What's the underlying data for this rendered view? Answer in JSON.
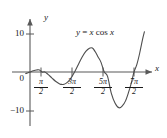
{
  "chart_data": {
    "type": "line",
    "title": "",
    "annotation": "y = x cos x",
    "function": "y = x cos x",
    "xlabel": "x",
    "ylabel": "y",
    "xlim": [
      -0.6,
      12.2
    ],
    "ylim": [
      -13.5,
      12.5
    ],
    "grid": false,
    "legend": false,
    "x_tick_labels": [
      "π/2",
      "3π/2",
      "5π/2",
      "7π/2"
    ],
    "x_tick_values": [
      1.5708,
      4.7124,
      7.854,
      10.9956
    ],
    "y_tick_labels": [
      "10",
      "0",
      "-10"
    ],
    "y_tick_values": [
      10,
      0,
      -10
    ],
    "series": [
      {
        "name": "y = x cos x",
        "x": [
          -0.45,
          -0.2,
          0,
          0.35,
          0.7,
          1.0,
          1.2708,
          1.5708,
          1.9,
          2.3,
          2.7,
          3.1416,
          3.4,
          3.6,
          3.8,
          4.0,
          4.3,
          4.7124,
          5.1,
          5.5,
          5.9,
          6.2832,
          6.6,
          6.9,
          7.2,
          7.5,
          7.854,
          8.2,
          8.6,
          9.0,
          9.42,
          9.8,
          10.1,
          10.4,
          10.7,
          10.9956,
          11.3,
          11.6,
          11.9,
          12.1
        ],
        "y": [
          -0.41,
          -0.196,
          0,
          0.329,
          0.535,
          0.54,
          0.0,
          -0.0,
          -0.614,
          -1.53,
          -2.44,
          -3.14,
          -3.27,
          -3.2,
          -3.0,
          -2.61,
          -1.73,
          0.0,
          1.93,
          3.9,
          5.43,
          6.28,
          6.3,
          5.31,
          3.94,
          2.6,
          0.0,
          -1.14,
          -5.62,
          -8.2,
          -9.42,
          -8.8,
          -7.6,
          -5.5,
          -3.0,
          0.0,
          2.0,
          5.0,
          8.6,
          10.6
        ]
      }
    ]
  },
  "labels": {
    "y_axis_name": "y",
    "x_axis_name": "x",
    "y_top": "10",
    "y_zero": "0",
    "y_bottom": "−10",
    "tick1_num": "π",
    "tick1_den": "2",
    "tick2_num": "3π",
    "tick2_den": "2",
    "tick3_num": "5π",
    "tick3_den": "2",
    "tick4_num": "7π",
    "tick4_den": "2",
    "equation_lhs": "y",
    "equation_eq": "=",
    "equation_var1": "x",
    "equation_fn": "cos",
    "equation_var2": "x"
  },
  "colors": {
    "curve": "#4d4d4d",
    "axis": "#595959",
    "text": "#1a1a1a",
    "background": "#ffffff"
  }
}
